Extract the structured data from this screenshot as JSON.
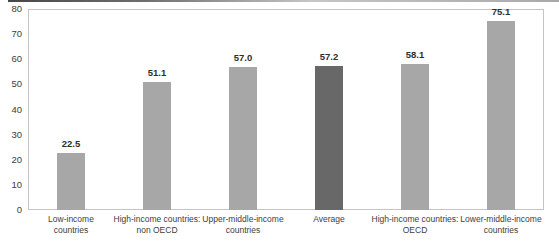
{
  "chart_data": {
    "type": "bar",
    "title": "",
    "xlabel": "",
    "ylabel": "",
    "categories": [
      "Low-income countries",
      "High-income countries: non OECD",
      "Upper-middle-income countries",
      "Average",
      "High-income countries: OECD",
      "Lower-middle-income countries"
    ],
    "category_display": [
      "Low-income\ncountries",
      "High-income countries:\nnon OECD",
      "Upper-middle-income\ncountries",
      "Average",
      "High-income countries:\nOECD",
      "Lower-middle-income\ncountries"
    ],
    "values": [
      22.5,
      51.1,
      57.0,
      57.2,
      58.1,
      75.1
    ],
    "value_labels": [
      "22.5",
      "51.1",
      "57.0",
      "57.2",
      "58.1",
      "75.1"
    ],
    "highlight_category": "Average",
    "highlight_index": 3,
    "ylim": [
      0,
      80
    ],
    "yticks": [
      0,
      10,
      20,
      30,
      40,
      50,
      60,
      70,
      80
    ],
    "grid": false,
    "legend": "none",
    "colors": {
      "bar": "#a7a7a7",
      "highlight_bar": "#686868",
      "plot_border": "#c4c4c4",
      "tick_text": "#3d3d3d",
      "value_text": "#2e2e2e",
      "category_text": "#3d3d3d",
      "background": "#ffffff"
    }
  }
}
